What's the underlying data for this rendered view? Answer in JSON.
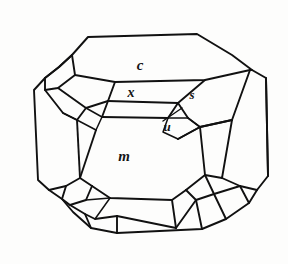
{
  "figure": {
    "name": "crystal-habit-drawing",
    "background_color": "#fdfdfc",
    "line_color": "#111111",
    "face_fill_color": "#fdfdfc"
  },
  "labels": {
    "c": {
      "text": "c",
      "x": 140,
      "y": 70,
      "description": "basal face label on top pinacoid"
    },
    "x": {
      "text": "x",
      "x": 131,
      "y": 97,
      "description": "upper bevel face label"
    },
    "s": {
      "text": "s",
      "x": 192,
      "y": 99,
      "description": "right upper corner face label"
    },
    "u": {
      "text": "u",
      "x": 167,
      "y": 131,
      "description": "small diamond facet label with leader line"
    },
    "m": {
      "text": "m",
      "x": 124,
      "y": 161,
      "description": "large front prism face label"
    }
  },
  "leader_line": {
    "name": "u-leader",
    "x1": 163,
    "y1": 121,
    "x2": 182,
    "y2": 108
  },
  "outline": {
    "name": "crystal-outer-outline",
    "points": "88,37 197,34 232,55 252,70 266,78 268,176 257,190 249,203 226,219 202,229 117,233 91,228 73,212 62,199 49,190 38,180 34,90 45,78 59,67 72,55"
  },
  "paths": {
    "top_face_c": "88,37 197,34 232,55 250,70 205,80 115,82 75,75 72,55",
    "top_face_c_lower_edge": "75,75 115,82 205,80 250,70",
    "upper_left_facet_a": "72,55 75,75 58,88 45,78 59,67",
    "upper_left_facet_b": "75,75 115,82 108,101 86,108 58,88",
    "upper_left_facet_c": "58,88 86,108 77,120 63,113 45,90 45,78",
    "x_band": "108,101 178,103 168,118 102,117",
    "x_band_left": "108,101 102,117 86,108",
    "left_thin_sliver": "86,108 102,117 96,130 77,120",
    "s_facet": "178,103 205,80 250,70 232,120 200,127 188,118",
    "u_facet": "168,118 188,118 200,127 178,139 163,132",
    "m_face": "96,130 102,117 168,118 178,139 200,127 205,175 186,190 172,200 110,198 92,186 80,178 77,120",
    "left_side_face": "45,90 63,113 77,120 80,178 66,186 49,190 38,180 34,90 45,78",
    "right_side_face": "232,120 250,70 266,78 268,176 257,190 240,186 222,178 205,175 200,127",
    "bottom_left_corner_1": "66,186 80,178 92,186 86,200 70,205 62,199",
    "bottom_left_corner_2": "49,190 66,186 62,199 70,205 85,214 91,228 73,212",
    "bottom_left_corner_3": "70,205 86,200 110,198 117,216 117,233 91,228 85,214",
    "bottom_left_facet_inner": "86,200 110,198 117,216 95,219",
    "bottom_right_corner_1": "186,190 205,175 222,178 214,194 196,200",
    "bottom_right_corner_2": "222,178 240,186 249,203 226,219 214,194",
    "bottom_right_corner_3": "172,200 186,190 196,200 202,229 176,228",
    "bottom_right_facet_inner": "196,200 214,194 226,219 202,229",
    "bottom_edge_band": "117,216 117,233 176,228 172,200 110,198"
  }
}
